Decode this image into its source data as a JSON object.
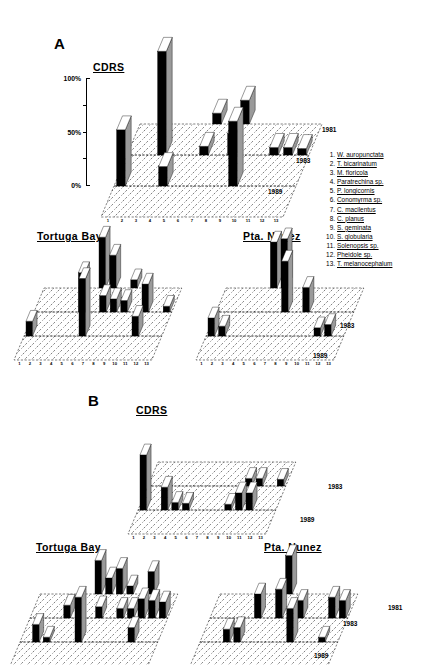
{
  "figure": {
    "panels": [
      {
        "letter": "A",
        "plots": [
          {
            "site": "CDRS",
            "years": [
              "1981",
              "1983",
              "1989"
            ],
            "x_ticks": [
              "1",
              "2",
              "3",
              "4",
              "5",
              "6",
              "7",
              "8",
              "9",
              "10",
              "11",
              "12",
              "13"
            ],
            "y_axis": {
              "ticks": [
                "100%",
                "50%",
                "0%"
              ],
              "values": [
                100,
                50,
                0
              ]
            },
            "series": [
              {
                "year": "1981",
                "values": [
                  0,
                  0,
                  0,
                  0,
                  0,
                  10,
                  0,
                  22,
                  0,
                  0,
                  0,
                  0,
                  0
                ]
              },
              {
                "year": "1983",
                "values": [
                  0,
                  0,
                  96,
                  0,
                  0,
                  8,
                  0,
                  20,
                  0,
                  0,
                  7,
                  7,
                  6
                ]
              },
              {
                "year": "1989",
                "values": [
                  52,
                  0,
                  0,
                  18,
                  0,
                  0,
                  0,
                  0,
                  60,
                  0,
                  0,
                  0,
                  0
                ]
              }
            ]
          },
          {
            "site": "Tortuga Bay",
            "years": [
              "1981",
              "1983",
              "1989"
            ],
            "x_ticks": [
              "1",
              "2",
              "3",
              "4",
              "5",
              "6",
              "7",
              "8",
              "9",
              "10",
              "11",
              "12",
              "13"
            ],
            "series": [
              {
                "year": "1981",
                "values": [
                  0,
                  0,
                  0,
                  0,
                  0,
                  62,
                  40,
                  0,
                  10,
                  0,
                  0,
                  0,
                  0
                ]
              },
              {
                "year": "1983",
                "values": [
                  0,
                  0,
                  0,
                  0,
                  48,
                  0,
                  20,
                  16,
                  14,
                  0,
                  34,
                  0,
                  7
                ]
              },
              {
                "year": "1989",
                "values": [
                  18,
                  0,
                  0,
                  0,
                  0,
                  70,
                  0,
                  0,
                  0,
                  0,
                  24,
                  0,
                  0
                ]
              }
            ]
          },
          {
            "site": "Pta. Nunez",
            "years": [
              "1981",
              "1983",
              "1989"
            ],
            "x_ticks": [
              "1",
              "2",
              "3",
              "4",
              "5",
              "6",
              "7",
              "8",
              "9",
              "10",
              "11",
              "12",
              "13"
            ],
            "series": [
              {
                "year": "1981",
                "values": [
                  0,
                  0,
                  0,
                  0,
                  56,
                  60,
                  0,
                  0,
                  0,
                  0,
                  0,
                  0,
                  0
                ]
              },
              {
                "year": "1983",
                "values": [
                  0,
                  0,
                  0,
                  0,
                  0,
                  0,
                  62,
                  0,
                  30,
                  0,
                  0,
                  0,
                  0
                ]
              },
              {
                "year": "1989",
                "values": [
                  22,
                  12,
                  0,
                  0,
                  0,
                  0,
                  0,
                  0,
                  0,
                  0,
                  10,
                  14,
                  0
                ]
              }
            ]
          }
        ]
      },
      {
        "letter": "B",
        "plots": [
          {
            "site": "CDRS",
            "years": [
              "1981",
              "1983",
              "1989"
            ],
            "x_ticks": [
              "1",
              "2",
              "3",
              "4",
              "5",
              "6",
              "7",
              "8",
              "9",
              "10",
              "11",
              "12",
              "13"
            ],
            "series": [
              {
                "year": "1981",
                "values": [
                  0,
                  0,
                  0,
                  0,
                  0,
                  0,
                  0,
                  0,
                  0,
                  0,
                  0,
                  0,
                  0
                ]
              },
              {
                "year": "1983",
                "values": [
                  0,
                  0,
                  0,
                  0,
                  0,
                  0,
                  0,
                  0,
                  0,
                  8,
                  8,
                  0,
                  7
                ]
              },
              {
                "year": "1989",
                "values": [
                  58,
                  0,
                  24,
                  8,
                  7,
                  0,
                  0,
                  0,
                  6,
                  18,
                  18,
                  0,
                  0
                ]
              }
            ]
          },
          {
            "site": "Tortuga Bay",
            "years": [
              "1981",
              "1983",
              "1989"
            ],
            "x_ticks": [
              "1",
              "2",
              "3",
              "4",
              "5",
              "6",
              "7",
              "8",
              "9",
              "10",
              "11",
              "12",
              "13"
            ],
            "series": [
              {
                "year": "1981",
                "values": [
                  0,
                  0,
                  0,
                  0,
                  0,
                  42,
                  20,
                  32,
                  10,
                  0,
                  28,
                  0,
                  0
                ]
              },
              {
                "year": "1983",
                "values": [
                  0,
                  0,
                  0,
                  16,
                  0,
                  0,
                  14,
                  0,
                  12,
                  12,
                  24,
                  22,
                  20
                ]
              },
              {
                "year": "1989",
                "values": [
                  0,
                  22,
                  6,
                  0,
                  0,
                  56,
                  0,
                  0,
                  0,
                  0,
                  18,
                  0,
                  0
                ]
              }
            ]
          },
          {
            "site": "Pta. Nunez",
            "years": [
              "1981",
              "1983",
              "1989"
            ],
            "x_ticks": [
              "1",
              "2",
              "3",
              "4",
              "5",
              "6",
              "7",
              "8",
              "9",
              "10",
              "11",
              "12",
              "13"
            ],
            "series": [
              {
                "year": "1981",
                "values": [
                  0,
                  0,
                  0,
                  0,
                  0,
                  0,
                  48,
                  0,
                  0,
                  0,
                  0,
                  0,
                  0
                ]
              },
              {
                "year": "1983",
                "values": [
                  0,
                  0,
                  0,
                  0,
                  30,
                  0,
                  36,
                  0,
                  22,
                  0,
                  0,
                  26,
                  22
                ]
              },
              {
                "year": "1989",
                "values": [
                  0,
                  0,
                  16,
                  18,
                  0,
                  0,
                  0,
                  0,
                  42,
                  0,
                  0,
                  6,
                  0
                ]
              }
            ]
          }
        ]
      }
    ]
  },
  "chart_data": {
    "type": "bar",
    "xlabel": "Ant species (1-13)",
    "ylabel": "CDRS",
    "ylim": [
      0,
      100
    ],
    "grid": true,
    "legend_position": "right",
    "categories": [
      "1",
      "2",
      "3",
      "4",
      "5",
      "6",
      "7",
      "8",
      "9",
      "10",
      "11",
      "12",
      "13"
    ],
    "depth_axis": [
      "1981",
      "1983",
      "1989"
    ],
    "panels": [
      "A",
      "B"
    ],
    "sites": [
      "CDRS",
      "Tortuga Bay",
      "Pta. Nunez"
    ],
    "annotations": [
      "A",
      "B",
      "CDRS",
      "Tortuga Bay",
      "Pta. Nunez",
      "1981",
      "1983",
      "1989",
      "100%",
      "50%",
      "0%"
    ]
  },
  "legend": {
    "items": [
      {
        "num": "1.",
        "name": "W. auropunctata"
      },
      {
        "num": "2.",
        "name": "T. bicarinatum"
      },
      {
        "num": "3.",
        "name": "M. floricola"
      },
      {
        "num": "4.",
        "name": "Paratrechina sp."
      },
      {
        "num": "5.",
        "name": "P. longicornis"
      },
      {
        "num": "6.",
        "name": "Conomyrma sp."
      },
      {
        "num": "7.",
        "name": "C. macilentus"
      },
      {
        "num": "8.",
        "name": "C. planus"
      },
      {
        "num": "9.",
        "name": "S. geminata"
      },
      {
        "num": "10.",
        "name": "S. globularia"
      },
      {
        "num": "11.",
        "name": "Solenopsis sp."
      },
      {
        "num": "12.",
        "name": "Pheidole sp."
      },
      {
        "num": "13.",
        "name": "T. melanocephalum"
      }
    ]
  },
  "stray_labels": {
    "panel_b_right_year": "1981"
  },
  "colors": {
    "bar_front": "#000000",
    "bar_side": "#9a9a9a",
    "bar_top": "#ffffff",
    "ink": "#000000",
    "background": "#ffffff"
  }
}
